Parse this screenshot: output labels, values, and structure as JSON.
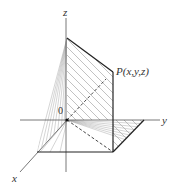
{
  "diagram": {
    "labels": {
      "z_axis": "z",
      "y_axis": "y",
      "x_axis": "x",
      "origin": "0",
      "point": "P(x,y,z)"
    },
    "colors": {
      "axis": "#555555",
      "edge": "#222222",
      "hatch": "#999999",
      "dashed": "#333333"
    },
    "points": {
      "origin": [
        67,
        120
      ],
      "z_top_plane": [
        67,
        38
      ],
      "P": [
        113,
        72
      ],
      "P_bottom": [
        113,
        152
      ],
      "y_corner": [
        144,
        120
      ],
      "front_left": [
        37,
        152
      ]
    }
  }
}
